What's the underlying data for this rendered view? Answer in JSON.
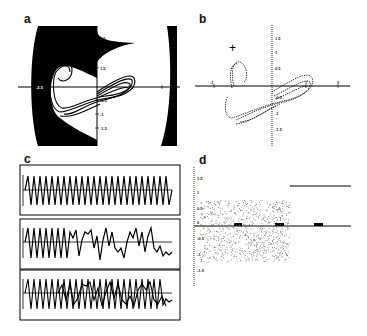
{
  "figure": {
    "panels": {
      "a": {
        "label": "a",
        "description": "Basin of attraction (black) with attractor loops in phase plane",
        "x_ticks": [
          "-2.5",
          "1",
          "2"
        ],
        "y_ticks": [
          "2.5",
          "2",
          "1.5",
          "-0.5",
          "-1",
          "-1.5"
        ]
      },
      "b": {
        "label": "b",
        "description": "Dotted phase-plane trajectories with cross marker",
        "marker": "+",
        "x_ticks": [
          "-1",
          "1",
          "2"
        ],
        "y_ticks": [
          "1.5",
          "1",
          "0.5",
          "0",
          "-0.5",
          "-1",
          "-1.5"
        ]
      },
      "c": {
        "label": "c",
        "description": "Three time-series traces: periodic, intermittent, and superposed",
        "traces": [
          "periodic",
          "irregular",
          "overlay"
        ]
      },
      "d": {
        "label": "d",
        "description": "Scatter of sampled values over time with a constant line at right",
        "y_ticks": [
          "1.5",
          "1",
          "0.5",
          "0",
          "-0.5",
          "-1",
          "-1.5"
        ]
      }
    }
  },
  "chart_data": [
    {
      "type": "line",
      "title": "a",
      "xlabel": "",
      "ylabel": "",
      "xlim": [
        -2.5,
        2.2
      ],
      "ylim": [
        -2,
        3
      ],
      "note": "phase-plane attractor inside black basin region"
    },
    {
      "type": "scatter",
      "title": "b",
      "xlim": [
        -1.5,
        2.2
      ],
      "ylim": [
        -2,
        2
      ],
      "annotations": [
        "+"
      ]
    },
    {
      "type": "line",
      "title": "c",
      "series": [
        {
          "name": "trace-1",
          "peaks": 25,
          "pattern": "regular oscillation"
        },
        {
          "name": "trace-2",
          "pattern": "regular then irregular"
        },
        {
          "name": "trace-3",
          "pattern": "two superposed traces"
        }
      ]
    },
    {
      "type": "scatter",
      "title": "d",
      "ylim": [
        -2,
        2
      ],
      "y_ticks": [
        1.5,
        1,
        0.5,
        0,
        -0.5,
        -1,
        -1.5
      ],
      "scatter_band": [
        -1.2,
        0.7
      ],
      "constant_line_y": 1.2
    }
  ]
}
